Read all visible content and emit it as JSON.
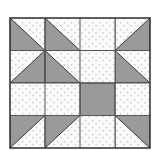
{
  "image": {
    "kind": "quilt-block-diagram",
    "title": "Quilt block pattern diagram",
    "width": 159,
    "height": 150,
    "background_color": "#ffffff"
  },
  "colors": {
    "background": "#ffffff",
    "light_fabric": "#fbfbfb",
    "light_fabric_dot": "#c9c9d4",
    "dark_fabric": "#9a9a9a",
    "dark_fabric_shadow": "#8e8e8e",
    "outline": "#3a3a3a",
    "grid_line": "#555555"
  },
  "block": {
    "name": "four-by-four-pinwheel-star-block",
    "grid_columns": 4,
    "grid_rows": 4,
    "origin_x": 10,
    "origin_y": 18,
    "cell_width": 35,
    "cell_height": 32.5,
    "symmetry": "4-fold mirror",
    "cropped_bottom": true
  },
  "legend": {
    "light_label": "light dotted fabric",
    "dark_label": "solid gray fabric"
  },
  "cells": [
    {
      "name": "cell-r1c1",
      "row": 1,
      "col": 1,
      "type": "half-square-triangle",
      "dark_corner": "bottom-left"
    },
    {
      "name": "cell-r1c2",
      "row": 1,
      "col": 2,
      "type": "half-square-triangle",
      "dark_corner": "bottom-left"
    },
    {
      "name": "cell-r1c3",
      "row": 1,
      "col": 3,
      "type": "half-square-triangle",
      "dark_corner": "bottom-right"
    },
    {
      "name": "cell-r1c4",
      "row": 1,
      "col": 4,
      "type": "half-square-triangle",
      "dark_corner": "bottom-right"
    },
    {
      "name": "cell-r2c1",
      "row": 2,
      "col": 1,
      "type": "half-square-triangle",
      "dark_corner": "bottom-right"
    },
    {
      "name": "cell-r2c2",
      "row": 2,
      "col": 2,
      "type": "half-square-triangle",
      "dark_corner": "bottom-left"
    },
    {
      "name": "cell-r2c3",
      "row": 2,
      "col": 3,
      "type": "half-square-triangle",
      "dark_corner": "bottom-right"
    },
    {
      "name": "cell-r2c4",
      "row": 2,
      "col": 4,
      "type": "half-square-triangle",
      "dark_corner": "bottom-left"
    },
    {
      "name": "cell-r3c1",
      "row": 3,
      "col": 1,
      "type": "half-square-triangle",
      "dark_corner": "top-right"
    },
    {
      "name": "cell-r3c2",
      "row": 3,
      "col": 2,
      "type": "half-square-triangle",
      "dark_corner": "top-left"
    },
    {
      "name": "cell-r3c3",
      "row": 3,
      "col": 3,
      "type": "half-square-triangle",
      "dark_corner": "top-right"
    },
    {
      "name": "cell-r3c4",
      "row": 3,
      "col": 4,
      "type": "half-square-triangle",
      "dark_corner": "top-left"
    },
    {
      "name": "cell-r4c1",
      "row": 4,
      "col": 1,
      "type": "half-square-triangle",
      "dark_corner": "top-left"
    },
    {
      "name": "cell-r4c2",
      "row": 4,
      "col": 2,
      "type": "half-square-triangle",
      "dark_corner": "top-left"
    },
    {
      "name": "cell-r4c3",
      "row": 4,
      "col": 3,
      "type": "half-square-triangle",
      "dark_corner": "top-right"
    },
    {
      "name": "cell-r4c4",
      "row": 4,
      "col": 4,
      "type": "half-square-triangle",
      "dark_corner": "top-right"
    }
  ],
  "overlays": [
    {
      "name": "center-cross-vertical",
      "type": "light-bar",
      "orientation": "vertical"
    },
    {
      "name": "center-cross-horizontal",
      "type": "light-bar",
      "orientation": "horizontal"
    },
    {
      "name": "center-square",
      "type": "dark-square"
    }
  ]
}
